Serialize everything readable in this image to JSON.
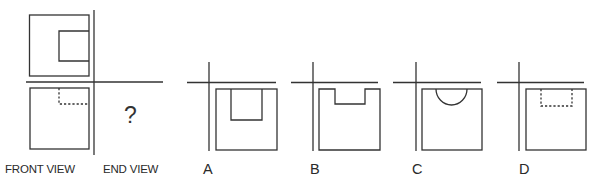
{
  "question": {
    "top_view_label": "TOP VIEW",
    "front_view_label": "FRONT VIEW",
    "end_view_label": "END VIEW",
    "unknown_marker": "?"
  },
  "options": [
    {
      "label": "A",
      "shape": "square-with-solid-rectangular-notch-deep"
    },
    {
      "label": "B",
      "shape": "square-with-open-top-notch-shallow"
    },
    {
      "label": "C",
      "shape": "square-with-semicircular-cut"
    },
    {
      "label": "D",
      "shape": "square-with-hidden-dashed-rectangle"
    }
  ],
  "colors": {
    "line": "#333333",
    "background": "#ffffff"
  }
}
